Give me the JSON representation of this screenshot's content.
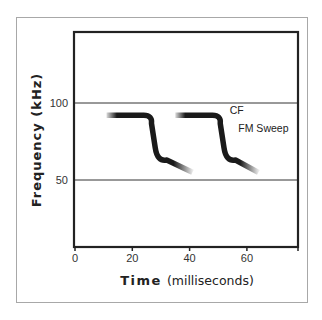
{
  "chart_data": {
    "type": "line",
    "title": "",
    "xlabel": "Time (milliseconds)",
    "xlabel_parts": {
      "bold": "Time",
      "regular": "(milliseconds)"
    },
    "ylabel": "Frequency (kHz)",
    "xlim": [
      0,
      80
    ],
    "ylim": [
      0,
      140
    ],
    "x_ticks": [
      0,
      20,
      40,
      60
    ],
    "x_tick_labels": [
      "0",
      "20",
      "40",
      "60"
    ],
    "y_ticks": [
      50,
      100
    ],
    "y_tick_labels": [
      "50",
      "100"
    ],
    "grid": {
      "horizontal_lines_at": [
        50,
        100
      ]
    },
    "legend": null,
    "annotations": [
      {
        "text": "CF",
        "x": 54,
        "y": 93
      },
      {
        "text": "FM Sweep",
        "x": 57,
        "y": 81
      }
    ],
    "series": [
      {
        "name": "Call 1",
        "points": [
          [
            11,
            92
          ],
          [
            24,
            92
          ],
          [
            26,
            88
          ],
          [
            28,
            71
          ],
          [
            32,
            63
          ],
          [
            41,
            55
          ]
        ],
        "color": "#1a1a1a"
      },
      {
        "name": "Call 2",
        "points": [
          [
            35,
            92
          ],
          [
            48,
            92
          ],
          [
            50,
            88
          ],
          [
            52,
            71
          ],
          [
            56,
            63
          ],
          [
            64,
            55
          ]
        ],
        "color": "#1a1a1a"
      }
    ]
  }
}
